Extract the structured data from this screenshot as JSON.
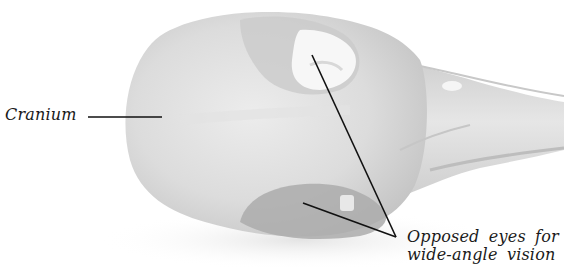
{
  "figure": {
    "colors": {
      "background": "#ffffff",
      "skull_base": "#d9d9d9",
      "skull_light": "#ececec",
      "skull_shadow": "#b8b8b8",
      "orbit_dark": "#a9a9a9",
      "leader_line": "#111111",
      "label_text": "#1a1a1a"
    }
  },
  "labels": {
    "cranium": "Cranium",
    "eyes_line1": "Opposed eyes for",
    "eyes_line2": "wide-angle vision"
  },
  "leader_lines": {
    "cranium": {
      "x1": 88,
      "y1": 117,
      "x2": 162,
      "y2": 117
    },
    "eye_upper": {
      "x1": 312,
      "y1": 55,
      "x2": 396,
      "y2": 237
    },
    "eye_lower": {
      "x1": 303,
      "y1": 203,
      "x2": 396,
      "y2": 237
    }
  }
}
